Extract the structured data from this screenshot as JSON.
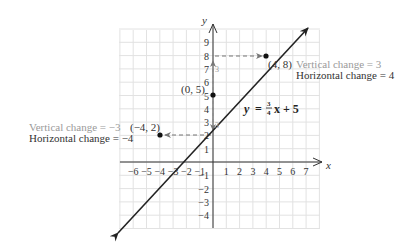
{
  "figure": {
    "type": "slope-diagram",
    "equation": {
      "lhs": "y",
      "equals": "=",
      "frac_num": "3",
      "frac_den": "4",
      "rhs": "x + 5"
    },
    "axes": {
      "x_label": "x",
      "y_label": "y",
      "x_ticks": [
        "−6",
        "−5",
        "−4",
        "−3",
        "−2",
        "−1",
        "1",
        "2",
        "3",
        "4",
        "5",
        "6",
        "7"
      ],
      "y_ticks_pos": [
        "1",
        "2",
        "3",
        "4",
        "5",
        "6",
        "7",
        "8",
        "9"
      ],
      "y_ticks_neg": [
        "−1",
        "−2",
        "−3",
        "−4"
      ]
    },
    "points": [
      {
        "label": "(−4, 2)",
        "x": -4,
        "y": 2
      },
      {
        "label": "(0, 5)",
        "x": 0,
        "y": 5
      },
      {
        "label": "(4, 8)",
        "x": 4,
        "y": 8
      }
    ],
    "annotations": {
      "upper_vertical": "Vertical change = 3",
      "upper_horizontal": "Horizontal change = 4",
      "lower_vertical": "Vertical change = −3",
      "lower_horizontal": "Horizontal change = −4",
      "rise_label_upper": "3",
      "rise_label_lower": "3"
    },
    "colors": {
      "grid": "#e2e2e2",
      "line": "#222222",
      "dashed": "#777777",
      "annotation_gray": "#9a9a9a",
      "text": "#333333"
    }
  },
  "chart_data": {
    "type": "line",
    "title": "",
    "xlabel": "x",
    "ylabel": "y",
    "equation": "y = 3/4 x + 5",
    "xlim": [
      -6,
      7
    ],
    "ylim": [
      -4,
      9
    ],
    "grid": true,
    "series": [
      {
        "name": "y = (3/4)x + 5",
        "x": [
          -4,
          0,
          4
        ],
        "y": [
          2,
          5,
          8
        ]
      }
    ],
    "annotations": [
      "Vertical change = 3",
      "Horizontal change = 4",
      "Vertical change = −3",
      "Horizontal change = −4"
    ]
  }
}
